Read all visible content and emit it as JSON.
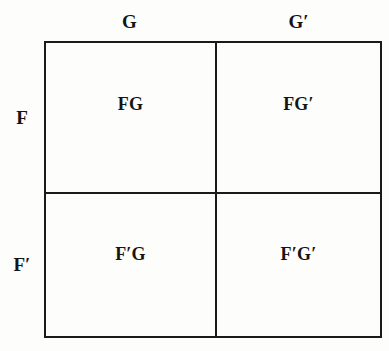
{
  "figure": {
    "type": "2x2-contingency-grid",
    "line_color": "#1a1a1a",
    "background_color": "#fdfdfb",
    "text_color": "#141414"
  },
  "column_headers": [
    {
      "id": "g",
      "label": "G"
    },
    {
      "id": "gp",
      "label": "G′"
    }
  ],
  "row_labels": [
    {
      "id": "f",
      "label": "F"
    },
    {
      "id": "fp",
      "label": "F′"
    }
  ],
  "cells": [
    {
      "id": "fg",
      "row": "F",
      "column": "G",
      "label": "FG"
    },
    {
      "id": "fgp",
      "row": "F",
      "column": "G′",
      "label": "FG′"
    },
    {
      "id": "fpg",
      "row": "F′",
      "column": "G",
      "label": "F′G"
    },
    {
      "id": "fpgp",
      "row": "F′",
      "column": "G′",
      "label": "F′G′"
    }
  ]
}
